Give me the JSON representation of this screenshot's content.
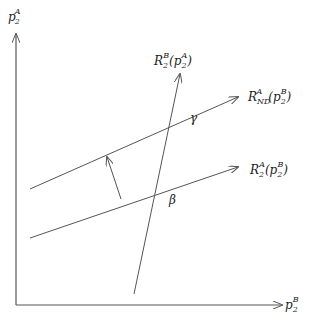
{
  "diagram": {
    "axes": {
      "y_label": {
        "base": "p",
        "sub": "2",
        "sup": "A"
      },
      "x_label": {
        "base": "p",
        "sub": "2",
        "sup": "B"
      }
    },
    "curves": [
      {
        "id": "R2B",
        "label_base": "R",
        "label_sub": "2",
        "label_sup": "B",
        "label_arg": "(p",
        "label_arg_sub": "2",
        "label_arg_sup": "A",
        "label_close": ")"
      },
      {
        "id": "RNDA",
        "label_base": "R",
        "label_sub": "ND",
        "label_sup": "A",
        "label_arg": "(p",
        "label_arg_sub": "2",
        "label_arg_sup": "B",
        "label_close": ")"
      },
      {
        "id": "R2A",
        "label_base": "R",
        "label_sub": "2",
        "label_sup": "A",
        "label_arg": "(p",
        "label_arg_sub": "2",
        "label_arg_sup": "B",
        "label_close": ")"
      }
    ],
    "points": [
      {
        "name": "gamma",
        "symbol": "γ"
      },
      {
        "name": "beta",
        "symbol": "β"
      }
    ],
    "line_color": "#555555"
  }
}
